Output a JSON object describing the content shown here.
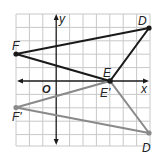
{
  "diagram": {
    "type": "coordinate-plane-reflection",
    "axes": {
      "x_label": "x",
      "y_label": "y",
      "origin_label": "O"
    },
    "grid": {
      "x_min": -4,
      "x_max": 7,
      "y_min": -5,
      "y_max": 5,
      "unit": 1
    },
    "colors": {
      "original": "#1a1a1a",
      "image": "#8a8a8a",
      "grid": "#c8c8c8",
      "axis": "#1a1a1a"
    },
    "original_triangle": {
      "vertices": [
        {
          "label": "D",
          "x": 7,
          "y": 4
        },
        {
          "label": "E",
          "x": 4,
          "y": 0
        },
        {
          "label": "F",
          "x": -3,
          "y": 2
        }
      ]
    },
    "image_triangle": {
      "vertices": [
        {
          "label": "D'",
          "x": 7,
          "y": -4
        },
        {
          "label": "E'",
          "x": 4,
          "y": 0
        },
        {
          "label": "F'",
          "x": -3,
          "y": -2
        }
      ]
    },
    "labels": {
      "D": "D",
      "E": "E",
      "F": "F",
      "D_prime": "D",
      "E_prime": "E'",
      "F_prime": "F'",
      "x": "x",
      "y": "y",
      "O": "O"
    }
  }
}
